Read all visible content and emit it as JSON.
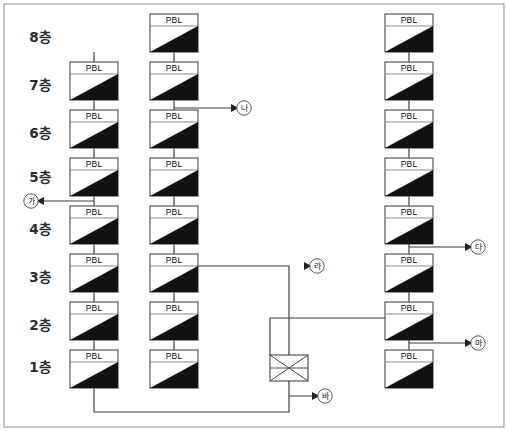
{
  "canvas": {
    "width": 508,
    "height": 431,
    "background": "#ffffff"
  },
  "frame": {
    "x": 4,
    "y": 4,
    "width": 500,
    "height": 423,
    "stroke": "#8d8d8d"
  },
  "colors": {
    "box_fill": "#ffffff",
    "box_stroke": "#4a4a4a",
    "triangle": "#111111",
    "pipe": "#3a3a3a",
    "text": "#1a1a1a",
    "marker_stroke": "#5a5a5a"
  },
  "geometry": {
    "box_width": 48,
    "box_height": 38,
    "header_height": 12,
    "column_x": [
      70,
      150,
      385
    ],
    "row_y": [
      14,
      62,
      110,
      158,
      206,
      254,
      302,
      350
    ]
  },
  "unit_label": "PBL",
  "floor_labels": [
    {
      "text": "8층",
      "x": 40,
      "y": 42
    },
    {
      "text": "7층",
      "x": 40,
      "y": 90
    },
    {
      "text": "6층",
      "x": 40,
      "y": 138
    },
    {
      "text": "5층",
      "x": 40,
      "y": 182
    },
    {
      "text": "4층",
      "x": 40,
      "y": 234
    },
    {
      "text": "3층",
      "x": 40,
      "y": 282
    },
    {
      "text": "2층",
      "x": 40,
      "y": 330
    },
    {
      "text": "1층",
      "x": 40,
      "y": 372
    }
  ],
  "columns": [
    {
      "name": "column-left",
      "x": 70,
      "floors": [
        "7",
        "6",
        "5",
        "4",
        "3",
        "2",
        "1"
      ],
      "row_indices": [
        1,
        2,
        3,
        4,
        5,
        6,
        7
      ]
    },
    {
      "name": "column-center",
      "x": 150,
      "floors": [
        "8",
        "7",
        "6",
        "5",
        "4",
        "3",
        "2",
        "1"
      ],
      "row_indices": [
        0,
        1,
        2,
        3,
        4,
        5,
        6,
        7
      ]
    },
    {
      "name": "column-right",
      "x": 385,
      "floors": [
        "8",
        "7",
        "6",
        "5",
        "4",
        "3",
        "2",
        "1"
      ],
      "row_indices": [
        0,
        1,
        2,
        3,
        4,
        5,
        6,
        7
      ]
    }
  ],
  "valve": {
    "name": "mixing-valve",
    "x": 270,
    "y": 355,
    "width": 38,
    "height": 26,
    "symbol": "x-crossed-rectangle"
  },
  "markers": [
    {
      "id": "ga",
      "text": "가",
      "cx": 31,
      "cy": 201,
      "arrow_from_x": 70,
      "arrow_to_x": 44,
      "arrow_y": 201,
      "direction": "left"
    },
    {
      "id": "na",
      "text": "나",
      "cx": 244,
      "cy": 108,
      "arrow_from_x": 174,
      "arrow_to_x": 231,
      "arrow_y": 108,
      "direction": "right"
    },
    {
      "id": "da",
      "text": "다",
      "cx": 478,
      "cy": 247,
      "arrow_from_x": 409,
      "arrow_to_x": 465,
      "arrow_y": 247,
      "direction": "right"
    },
    {
      "id": "ra",
      "text": "라",
      "cx": 317,
      "cy": 266,
      "arrow_from_x": 289,
      "arrow_to_x": 304,
      "arrow_y": 266,
      "direction": "right"
    },
    {
      "id": "ma",
      "text": "마",
      "cx": 478,
      "cy": 343,
      "arrow_from_x": 409,
      "arrow_to_x": 465,
      "arrow_y": 343,
      "direction": "right"
    },
    {
      "id": "ba",
      "text": "바",
      "cx": 325,
      "cy": 396,
      "arrow_from_x": 289,
      "arrow_to_x": 312,
      "arrow_y": 396,
      "direction": "right"
    }
  ],
  "connectors": [
    {
      "name": "riser-col-left",
      "points": "94,52 94,350"
    },
    {
      "name": "riser-col-center",
      "points": "174,52 174,350"
    },
    {
      "name": "riser-col-right",
      "points": "409,52 409,350"
    },
    {
      "name": "tap-na-from-center-7f",
      "points": "174,108 231,108"
    },
    {
      "name": "tap-ga-to-left-5f",
      "points": "94,201 44,201"
    },
    {
      "name": "tap-da-from-right-4f",
      "points": "409,247 465,247"
    },
    {
      "name": "tap-ma-from-right-2f",
      "points": "409,343 465,343"
    },
    {
      "name": "center-3f-to-valve",
      "points": "174,266 289,266 289,355"
    },
    {
      "name": "right-2f-to-valve",
      "points": "409,318 270,318 270,355"
    },
    {
      "name": "valve-outlet-to-ba",
      "points": "289,381 289,396 312,396"
    },
    {
      "name": "left-1f-return-loop",
      "points": "94,388 94,412 289,412 289,396"
    }
  ]
}
